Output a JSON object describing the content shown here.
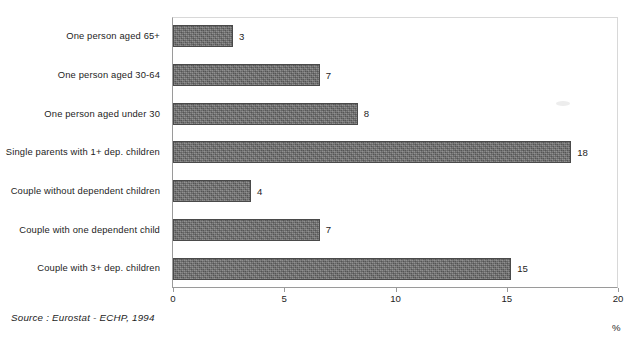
{
  "chart_data": {
    "type": "bar",
    "orientation": "horizontal",
    "title": "",
    "xlabel": "%",
    "ylabel": "",
    "xlim": [
      0,
      20
    ],
    "xticks": [
      "0",
      "5",
      "10",
      "15",
      "20"
    ],
    "grid": false,
    "legend": null,
    "categories": [
      "One person aged 65+",
      "One person aged 30-64",
      "One person aged under 30",
      "Single parents with 1+ dep. children",
      "Couple without dependent children",
      "Couple with one dependent child",
      "Couple with 3+ dep. children"
    ],
    "values": [
      2.7,
      6.6,
      8.3,
      17.9,
      3.5,
      6.6,
      15.2
    ],
    "data_labels": [
      "3",
      "7",
      "8",
      "18",
      "4",
      "7",
      "15"
    ],
    "bar_color": "#6f6f6f",
    "bar_edge_color": "#4a4a4a",
    "source_note": "Source : Eurostat - ECHP, 1994",
    "title_remnant": ""
  },
  "axis": {
    "unit_label": "%",
    "ticks": [
      {
        "label": "0",
        "value": 0
      },
      {
        "label": "5",
        "value": 5
      },
      {
        "label": "10",
        "value": 10
      },
      {
        "label": "15",
        "value": 15
      },
      {
        "label": "20",
        "value": 20
      }
    ]
  },
  "footer": {
    "source": "Source : Eurostat - ECHP, 1994"
  }
}
